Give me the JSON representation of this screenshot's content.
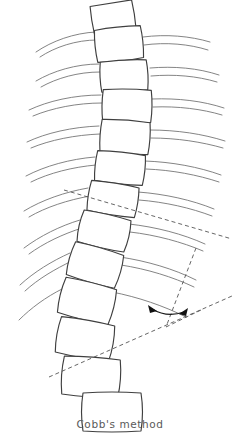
{
  "figure": {
    "caption": "Cobb's method",
    "title": "Cobb's method",
    "ink_color": "#4a4a4a",
    "bone_color": "#3f3f3f",
    "rib_color": "#6b6b6b",
    "construction_color": "#555555",
    "background": "#ffffff",
    "measurement": {
      "name": "Cobb angle",
      "upper_end_vertebra_line": "superior endplate tangent",
      "lower_end_vertebra_line": "inferior endplate tangent",
      "intersection": "perpendiculars meet at apex",
      "arc_marker": "double-headed arc"
    },
    "structures": {
      "vertebrae_label": "vertebral bodies",
      "left_ribs_label": "left ribs",
      "right_ribs_label": "right ribs",
      "vertebra_count": 13,
      "left_rib_count": 9,
      "right_rib_count": 9
    }
  },
  "geometry": {
    "vertebrae": [
      {
        "cx": 119,
        "cy": 44,
        "w": 46,
        "h": 33,
        "rot": -6
      },
      {
        "cx": 124,
        "cy": 76,
        "w": 46,
        "h": 31,
        "rot": -3
      },
      {
        "cx": 127,
        "cy": 106,
        "w": 48,
        "h": 32,
        "rot": 1
      },
      {
        "cx": 125,
        "cy": 137,
        "w": 49,
        "h": 32,
        "rot": 4
      },
      {
        "cx": 120,
        "cy": 168,
        "w": 48,
        "h": 31,
        "rot": 6
      },
      {
        "cx": 113,
        "cy": 199,
        "w": 48,
        "h": 31,
        "rot": 9
      },
      {
        "cx": 104,
        "cy": 231,
        "w": 49,
        "h": 32,
        "rot": 13
      },
      {
        "cx": 95,
        "cy": 265,
        "w": 51,
        "h": 34,
        "rot": 16
      },
      {
        "cx": 87,
        "cy": 301,
        "w": 53,
        "h": 36,
        "rot": 14
      },
      {
        "cx": 85,
        "cy": 339,
        "w": 55,
        "h": 37,
        "rot": 10
      },
      {
        "cx": 91,
        "cy": 377,
        "w": 57,
        "h": 38,
        "rot": 4
      },
      {
        "cx": 112,
        "cy": 412,
        "w": 58,
        "h": 38,
        "rot": 0
      },
      {
        "cx": 113,
        "cy": 17,
        "w": 42,
        "h": 28,
        "rot": -9
      }
    ],
    "construction": {
      "upper_line": {
        "x1": 64,
        "y1": 190,
        "x2": 232,
        "y2": 239
      },
      "lower_line": {
        "x1": 49,
        "y1": 377,
        "x2": 232,
        "y2": 296
      },
      "upper_perp": {
        "x1": 196,
        "y1": 248,
        "x2": 166,
        "y2": 327
      },
      "lower_perp": {
        "x1": 200,
        "y1": 310,
        "x2": 166,
        "y2": 327
      },
      "apex": {
        "x": 166,
        "y": 327
      },
      "arc_radius": 26
    }
  }
}
